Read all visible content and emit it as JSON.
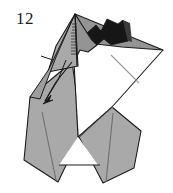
{
  "diagram": {
    "step_number": "12",
    "caption": "",
    "type": "origami-fold-step",
    "background_color": "#ffffff",
    "colors": {
      "paper_light": "#a9a9a9",
      "paper_mid": "#949494",
      "paper_dark": "#6f6f6f",
      "paper_shadow": "#2a2a2a",
      "paper_black": "#161616",
      "paper_white": "#ffffff",
      "outline": "#1c1c1c",
      "crease_line": "#8c8c8c",
      "number_color": "#1a1a1a"
    },
    "annotations": {
      "fold_arrow_label": "fold arrow",
      "tick_mark_label": "reference tick",
      "crease_hint_label": "crease line"
    },
    "parts": [
      {
        "name": "top-apex",
        "fill": "#a9a9a9"
      },
      {
        "name": "upper-left-flap",
        "fill": "#949494"
      },
      {
        "name": "dark-zigzag-flap",
        "fill": "#161616"
      },
      {
        "name": "right-wing",
        "fill": "#949494"
      },
      {
        "name": "white-body-panel",
        "fill": "#ffffff"
      },
      {
        "name": "left-leg",
        "fill": "#a9a9a9"
      },
      {
        "name": "right-leg",
        "fill": "#a9a9a9"
      },
      {
        "name": "left-body-wedge",
        "fill": "#a9a9a9"
      },
      {
        "name": "center-white-notch",
        "fill": "#ffffff"
      }
    ]
  }
}
